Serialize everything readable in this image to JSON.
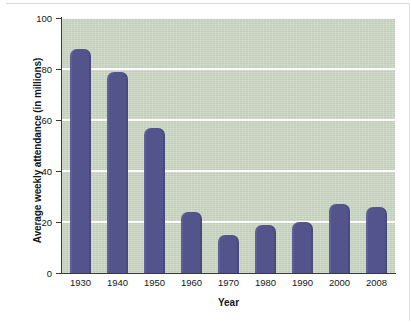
{
  "chart_data": {
    "type": "bar",
    "title": "",
    "xlabel": "Year",
    "ylabel": "Average weekly attendance (in millions)",
    "categories": [
      "1930",
      "1940",
      "1950",
      "1960",
      "1970",
      "1980",
      "1990",
      "2000",
      "2008"
    ],
    "values": [
      88,
      79,
      57,
      24,
      15,
      19,
      20,
      27,
      26
    ],
    "ylim": [
      0,
      100
    ],
    "yticks": [
      0,
      20,
      40,
      60,
      80,
      100
    ],
    "ytick_labels": [
      "0",
      "20",
      "40",
      "60",
      "80",
      "100"
    ],
    "grid": "horizontal",
    "legend": "none",
    "series": [
      {
        "name": "Average weekly attendance",
        "values": [
          88,
          79,
          57,
          24,
          15,
          19,
          20,
          27,
          26
        ]
      }
    ]
  },
  "colors": {
    "bar": "#53548C",
    "plot_background": "#C6D2BE",
    "gridline": "#FDFDFB",
    "axis": "#3A3A3A",
    "text": "#15161A",
    "page_background": "#FFFFFF"
  }
}
